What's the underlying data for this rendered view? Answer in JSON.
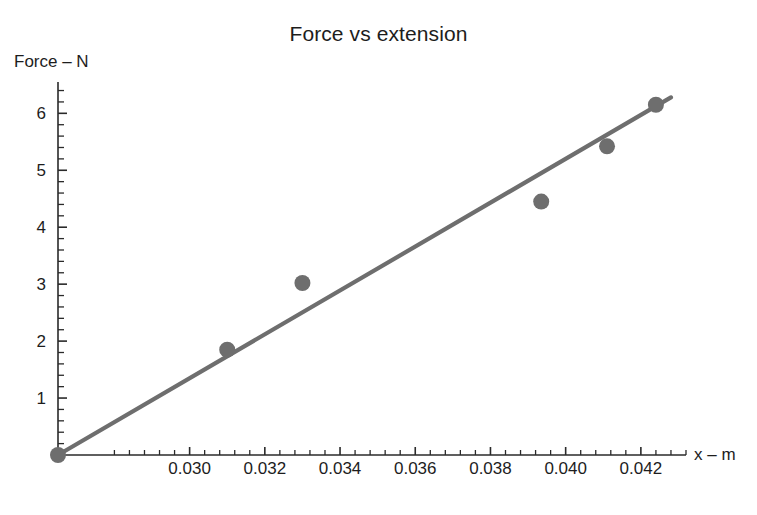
{
  "chart_data": {
    "type": "scatter",
    "title": "Force vs extension",
    "xlabel": "x – m",
    "ylabel": "Force – N",
    "grid": false,
    "legend": null,
    "xlim": [
      0.0265,
      0.0432
    ],
    "ylim": [
      0,
      6.55
    ],
    "x_ticks": [
      0.03,
      0.032,
      0.034,
      0.036,
      0.038,
      0.04,
      0.042
    ],
    "x_tick_labels": [
      "0.030",
      "0.032",
      "0.034",
      "0.036",
      "0.038",
      "0.040",
      "0.042"
    ],
    "x_minor_per_interval": 4,
    "y_ticks": [
      1,
      2,
      3,
      4,
      5,
      6
    ],
    "y_tick_labels": [
      "1",
      "2",
      "3",
      "4",
      "5",
      "6"
    ],
    "y_minor_per_interval": 4,
    "marker_color": "#6e6e6e",
    "line_color": "#6e6e6e",
    "axis_color": "#2a2a2a",
    "points": [
      {
        "x": 0.0265,
        "y": 0.0
      },
      {
        "x": 0.031,
        "y": 1.85
      },
      {
        "x": 0.033,
        "y": 3.02
      },
      {
        "x": 0.03935,
        "y": 4.45
      },
      {
        "x": 0.0411,
        "y": 5.42
      },
      {
        "x": 0.0424,
        "y": 6.15
      }
    ],
    "fit_line": {
      "x1": 0.0265,
      "y1": 0.0,
      "x2": 0.0428,
      "y2": 6.28
    }
  },
  "labels": {
    "title": "Force vs extension",
    "ylabel": "Force – N",
    "xlabel": "x – m"
  }
}
